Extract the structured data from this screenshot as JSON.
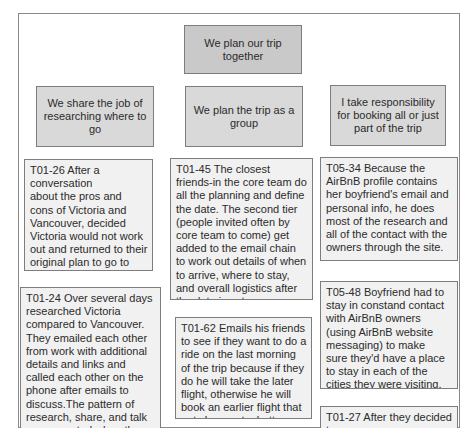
{
  "diagram": {
    "root": {
      "label": "We plan our trip together"
    },
    "categories": [
      {
        "label": "We share the job of researching where to go",
        "notes": [
          {
            "text": "T01-26 After a\nconversation\nabout the pros and cons of Victoria and Vancouver, decided Victoria would not work out and returned to their original plan to go to Vancouver"
          },
          {
            "text": "T01-24 Over several days researched Victoria compared to Vancouver. They emailed each other from work with additional details and links and called each other on the phone after emails to discuss.The pattern of research, share, and talk was repeated when they were not co-located."
          }
        ]
      },
      {
        "label": "We plan the trip as a group",
        "notes": [
          {
            "text": "T01-45 The closest friends-in the core team do all the planning and define the date. The second tier (people invited often by core team to come) get added to the email chain to work out details of when to arrive, where to stay, and overall logistics after the date is set"
          },
          {
            "text": "T01-62 Emails his friends to see if they want to do a ride on the last morning of the trip because if they do he will take the later flight, otherwise he will book an earlier flight that gets home at a better time."
          }
        ]
      },
      {
        "label": "I take responsibility for booking all or just part of the trip",
        "notes": [
          {
            "text": "T05-34 Because the AirBnB profile contains her boyfriend's email and personal info, he does most of the research and all of the contact with the owners through the site."
          },
          {
            "text": "T05-48 Boyfriend had to stay in constand contact with AirBnB owners (using AirBnB website messaging) to make\nsure they'd have a place to stay in each of the cities they were visiting."
          },
          {
            "text": "T01-27 After they decided to"
          }
        ]
      }
    ]
  },
  "colors": {
    "root_fill": "#c9c9c9",
    "category_fill": "#d9d9d9",
    "note_fill": "#f1f1f1",
    "border": "#7d7d7d"
  }
}
